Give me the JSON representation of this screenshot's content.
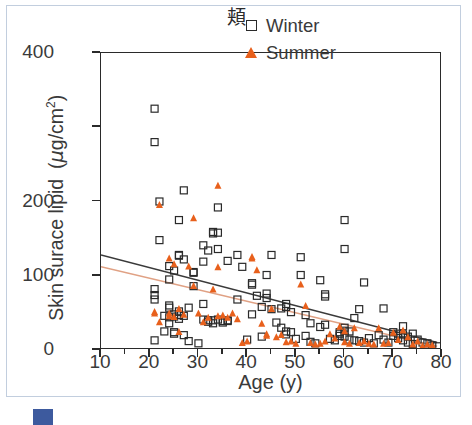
{
  "chart_data": {
    "type": "scatter",
    "title": "頬",
    "xlabel": "Age (y)",
    "ylabel": "Skin surace lipid (μg/cm2)",
    "ylabel_parts": {
      "main": "Skin surace lipid (",
      "mu": "μ",
      "unit": "g/cm",
      "exponent": "2",
      "close": ")"
    },
    "xlim": [
      10,
      80
    ],
    "ylim": [
      0,
      400
    ],
    "xticks": [
      10,
      20,
      30,
      40,
      50,
      60,
      70,
      80
    ],
    "yticks_labeled": [
      0,
      100,
      200,
      400
    ],
    "yticks_minor": [
      300
    ],
    "grid": false,
    "legend_position": "top-right",
    "legend": [
      {
        "name": "Winter",
        "marker": "open-square",
        "color": "#2a2a2a"
      },
      {
        "name": "Summer",
        "marker": "filled-triangle",
        "color": "#e8601c"
      }
    ],
    "series": [
      {
        "name": "Winter",
        "marker": "open-square",
        "color": "#2a2a2a",
        "points": [
          [
            21,
            325
          ],
          [
            21,
            280
          ],
          [
            22,
            200
          ],
          [
            22,
            148
          ],
          [
            21,
            82
          ],
          [
            21,
            74
          ],
          [
            21,
            68
          ],
          [
            21,
            13
          ],
          [
            23,
            46
          ],
          [
            23,
            25
          ],
          [
            24,
            113
          ],
          [
            24,
            95
          ],
          [
            24,
            60
          ],
          [
            24,
            57
          ],
          [
            24,
            44
          ],
          [
            24,
            36
          ],
          [
            25,
            107
          ],
          [
            25,
            48
          ],
          [
            25,
            45
          ],
          [
            25,
            24
          ],
          [
            25,
            22
          ],
          [
            26,
            128
          ],
          [
            26,
            127
          ],
          [
            26,
            175
          ],
          [
            26,
            52
          ],
          [
            26,
            47
          ],
          [
            26,
            42
          ],
          [
            27,
            215
          ],
          [
            27,
            122
          ],
          [
            27,
            46
          ],
          [
            27,
            20
          ],
          [
            28,
            57
          ],
          [
            28,
            12
          ],
          [
            29,
            105
          ],
          [
            29,
            104
          ],
          [
            29,
            86
          ],
          [
            30,
            9
          ],
          [
            31,
            141
          ],
          [
            31,
            119
          ],
          [
            31,
            62
          ],
          [
            31,
            41
          ],
          [
            32,
            134
          ],
          [
            32,
            40
          ],
          [
            32,
            38
          ],
          [
            33,
            157
          ],
          [
            33,
            159
          ],
          [
            33,
            40
          ],
          [
            33,
            36
          ],
          [
            34,
            192
          ],
          [
            34,
            158
          ],
          [
            34,
            136
          ],
          [
            34,
            41
          ],
          [
            35,
            39
          ],
          [
            35,
            37
          ],
          [
            36,
            120
          ],
          [
            36,
            40
          ],
          [
            36,
            39
          ],
          [
            38,
            128
          ],
          [
            38,
            68
          ],
          [
            39,
            112
          ],
          [
            40,
            14
          ],
          [
            41,
            90
          ],
          [
            41,
            88
          ],
          [
            41,
            48
          ],
          [
            42,
            73
          ],
          [
            43,
            58
          ],
          [
            43,
            18
          ],
          [
            44,
            101
          ],
          [
            44,
            76
          ],
          [
            44,
            70
          ],
          [
            45,
            128
          ],
          [
            45,
            55
          ],
          [
            46,
            37
          ],
          [
            47,
            56
          ],
          [
            47,
            30
          ],
          [
            48,
            62
          ],
          [
            48,
            58
          ],
          [
            48,
            25
          ],
          [
            48,
            21
          ],
          [
            49,
            51
          ],
          [
            49,
            24
          ],
          [
            50,
            15
          ],
          [
            51,
            125
          ],
          [
            51,
            101
          ],
          [
            52,
            47
          ],
          [
            52,
            19
          ],
          [
            53,
            36
          ],
          [
            53,
            11
          ],
          [
            54,
            9
          ],
          [
            55,
            94
          ],
          [
            55,
            31
          ],
          [
            56,
            75
          ],
          [
            56,
            72
          ],
          [
            56,
            34
          ],
          [
            57,
            15
          ],
          [
            58,
            13
          ],
          [
            59,
            24
          ],
          [
            59,
            22
          ],
          [
            59,
            19
          ],
          [
            60,
            175
          ],
          [
            60,
            136
          ],
          [
            60,
            30
          ],
          [
            60,
            26
          ],
          [
            60,
            18
          ],
          [
            61,
            25
          ],
          [
            61,
            14
          ],
          [
            62,
            43
          ],
          [
            62,
            13
          ],
          [
            63,
            55
          ],
          [
            63,
            12
          ],
          [
            64,
            91
          ],
          [
            64,
            10
          ],
          [
            65,
            16
          ],
          [
            66,
            9
          ],
          [
            67,
            20
          ],
          [
            68,
            56
          ],
          [
            68,
            14
          ],
          [
            69,
            10
          ],
          [
            70,
            24
          ],
          [
            70,
            19
          ],
          [
            71,
            22
          ],
          [
            71,
            16
          ],
          [
            72,
            32
          ],
          [
            72,
            21
          ],
          [
            72,
            13
          ],
          [
            73,
            18
          ],
          [
            73,
            10
          ],
          [
            74,
            22
          ],
          [
            74,
            8
          ],
          [
            75,
            14
          ],
          [
            76,
            10
          ],
          [
            77,
            9
          ],
          [
            78,
            6
          ],
          [
            79,
            5
          ]
        ]
      },
      {
        "name": "Summer",
        "marker": "filled-triangle",
        "color": "#e8601c",
        "points": [
          [
            22,
            196
          ],
          [
            21,
            52
          ],
          [
            21,
            50
          ],
          [
            22,
            38
          ],
          [
            24,
            124
          ],
          [
            24,
            50
          ],
          [
            24,
            46
          ],
          [
            25,
            116
          ],
          [
            25,
            45
          ],
          [
            26,
            56
          ],
          [
            26,
            25
          ],
          [
            27,
            48
          ],
          [
            28,
            113
          ],
          [
            29,
            178
          ],
          [
            29,
            87
          ],
          [
            30,
            50
          ],
          [
            31,
            38
          ],
          [
            32,
            44
          ],
          [
            33,
            82
          ],
          [
            34,
            222
          ],
          [
            34,
            112
          ],
          [
            34,
            46
          ],
          [
            35,
            47
          ],
          [
            36,
            44
          ],
          [
            37,
            50
          ],
          [
            38,
            42
          ],
          [
            39,
            10
          ],
          [
            40,
            12
          ],
          [
            41,
            126
          ],
          [
            41,
            124
          ],
          [
            42,
            108
          ],
          [
            43,
            36
          ],
          [
            44,
            22
          ],
          [
            44,
            20
          ],
          [
            45,
            56
          ],
          [
            46,
            18
          ],
          [
            47,
            21
          ],
          [
            48,
            11
          ],
          [
            49,
            12
          ],
          [
            50,
            9
          ],
          [
            51,
            89
          ],
          [
            52,
            60
          ],
          [
            53,
            10
          ],
          [
            54,
            8
          ],
          [
            55,
            9
          ],
          [
            56,
            12
          ],
          [
            57,
            22
          ],
          [
            58,
            16
          ],
          [
            59,
            32
          ],
          [
            60,
            26
          ],
          [
            60,
            11
          ],
          [
            61,
            9
          ],
          [
            62,
            30
          ],
          [
            63,
            10
          ],
          [
            64,
            12
          ],
          [
            65,
            9
          ],
          [
            66,
            8
          ],
          [
            67,
            30
          ],
          [
            68,
            9
          ],
          [
            69,
            10
          ],
          [
            70,
            24
          ],
          [
            71,
            14
          ],
          [
            72,
            27
          ],
          [
            73,
            18
          ],
          [
            74,
            8
          ],
          [
            75,
            12
          ],
          [
            76,
            6
          ],
          [
            77,
            8
          ],
          [
            78,
            7
          ]
        ]
      }
    ],
    "trendlines": [
      {
        "name": "Winter",
        "color": "#3a3a3a",
        "x0": 10,
        "y0": 128,
        "x1": 79,
        "y1": 10
      },
      {
        "name": "Summer",
        "color": "#e0a184",
        "x0": 10,
        "y0": 112,
        "x1": 79,
        "y1": 5
      }
    ]
  },
  "caption": {
    "badge": "",
    "text": ""
  }
}
